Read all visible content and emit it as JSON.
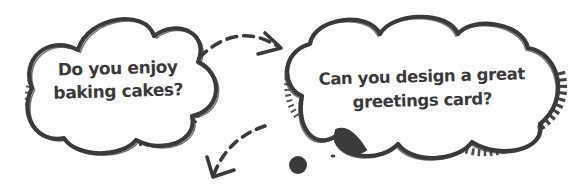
{
  "bubbles": {
    "left": {
      "line1": "Do you enjoy",
      "line2": "baking cakes?"
    },
    "right": {
      "line1": "Can you design a great",
      "line2": "greetings card?"
    }
  },
  "icons": {
    "arrow_top": "dashed-curved-arrow-right",
    "arrow_bottom": "dashed-curved-arrow-down-left",
    "thought_dots": "thought-bubble-dots"
  },
  "colors": {
    "ink": "#3a3a3a",
    "background": "#ffffff"
  }
}
